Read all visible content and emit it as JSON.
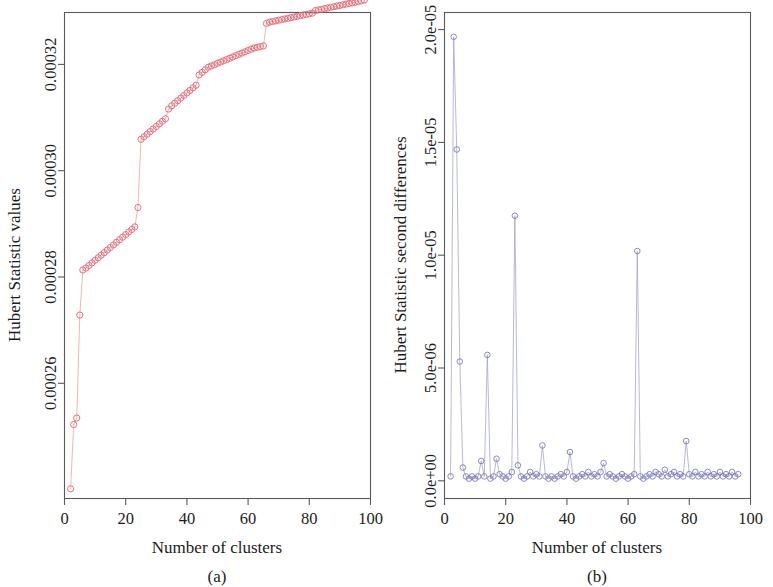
{
  "figure": {
    "background_color": "#ffffff",
    "panels": [
      {
        "id": "a",
        "caption": "(a)",
        "accent_color": "#e8636f"
      },
      {
        "id": "b",
        "caption": "(b)",
        "accent_color": "#6c6cba"
      }
    ]
  },
  "chart_data": [
    {
      "type": "line",
      "panel": "a",
      "title": "",
      "caption": "(a)",
      "xlabel": "Number of clusters",
      "ylabel": "Hubert Statistic values",
      "xlim": [
        0,
        100
      ],
      "ylim": [
        0.000251,
        0.0003265
      ],
      "grid": false,
      "legend": "none",
      "marker": "open-circle",
      "line_color": "#f2a0a6",
      "marker_color": "#e8636f",
      "xticks": [
        0,
        20,
        40,
        60,
        80,
        100
      ],
      "xticklabels": [
        "0",
        "20",
        "40",
        "60",
        "80",
        "100"
      ],
      "yticks": [
        0.00026,
        0.00028,
        0.0003,
        0.00032
      ],
      "yticklabels": [
        "0.00026",
        "0.00028",
        "0.00030",
        "0.00032"
      ],
      "x": [
        2,
        3,
        4,
        5,
        6,
        7,
        8,
        9,
        10,
        11,
        12,
        13,
        14,
        15,
        16,
        17,
        18,
        19,
        20,
        21,
        22,
        23,
        24,
        25,
        26,
        27,
        28,
        29,
        30,
        31,
        32,
        33,
        34,
        35,
        36,
        37,
        38,
        39,
        40,
        41,
        42,
        43,
        44,
        45,
        46,
        47,
        48,
        49,
        50,
        51,
        52,
        53,
        54,
        55,
        56,
        57,
        58,
        59,
        60,
        61,
        62,
        63,
        64,
        65,
        66,
        67,
        68,
        69,
        70,
        71,
        72,
        73,
        74,
        75,
        76,
        77,
        78,
        79,
        80,
        81,
        82,
        83,
        84,
        85,
        86,
        87,
        88,
        89,
        90,
        91,
        92,
        93,
        94,
        95,
        96,
        97,
        98
      ],
      "y": [
        0.0002525,
        0.0002625,
        0.0002635,
        0.0002795,
        0.0002865,
        0.0002868,
        0.0002872,
        0.0002876,
        0.000288,
        0.0002884,
        0.0002888,
        0.0002892,
        0.0002896,
        0.00029,
        0.0002904,
        0.0002908,
        0.0002912,
        0.0002916,
        0.000292,
        0.0002924,
        0.0002928,
        0.0002932,
        0.0002962,
        0.0003068,
        0.0003072,
        0.0003076,
        0.000308,
        0.0003084,
        0.0003088,
        0.0003092,
        0.0003096,
        0.00031,
        0.0003115,
        0.000312,
        0.0003124,
        0.0003128,
        0.0003132,
        0.0003136,
        0.000314,
        0.0003144,
        0.0003148,
        0.0003152,
        0.0003168,
        0.0003172,
        0.0003176,
        0.000318,
        0.0003182,
        0.0003184,
        0.0003186,
        0.0003188,
        0.000319,
        0.0003192,
        0.0003194,
        0.0003196,
        0.0003198,
        0.00032,
        0.0003202,
        0.0003204,
        0.0003206,
        0.0003208,
        0.000321,
        0.0003211,
        0.0003212,
        0.0003213,
        0.0003248,
        0.000325,
        0.0003251,
        0.0003252,
        0.0003253,
        0.0003254,
        0.0003255,
        0.0003256,
        0.0003257,
        0.0003258,
        0.0003259,
        0.000326,
        0.0003261,
        0.0003262,
        0.0003263,
        0.0003264,
        0.0003268,
        0.0003269,
        0.000327,
        0.0003271,
        0.0003272,
        0.0003273,
        0.0003274,
        0.0003275,
        0.0003276,
        0.0003277,
        0.0003278,
        0.0003279,
        0.000328,
        0.0003281,
        0.0003282,
        0.0003283
      ]
    },
    {
      "type": "line",
      "panel": "b",
      "title": "",
      "caption": "(b)",
      "xlabel": "Number of clusters",
      "ylabel": "Hubert Statistic second differences",
      "xlim": [
        0,
        100
      ],
      "ylim": [
        -8e-07,
        2.12e-05
      ],
      "grid": false,
      "legend": "none",
      "marker": "open-circle",
      "line_color": "#9a9ad0",
      "marker_color": "#6c6cba",
      "xticks": [
        0,
        20,
        40,
        60,
        80,
        100
      ],
      "xticklabels": [
        "0",
        "20",
        "40",
        "60",
        "80",
        "100"
      ],
      "yticks": [
        0,
        5e-06,
        1e-05,
        1.5e-05,
        2e-05
      ],
      "yticklabels": [
        "0.0e+00",
        "5.0e-06",
        "1.0e-05",
        "1.5e-05",
        "2.0e-05"
      ],
      "x": [
        2,
        3,
        4,
        5,
        6,
        7,
        8,
        9,
        10,
        11,
        12,
        13,
        14,
        15,
        16,
        17,
        18,
        19,
        20,
        21,
        22,
        23,
        24,
        25,
        26,
        27,
        28,
        29,
        30,
        31,
        32,
        33,
        34,
        35,
        36,
        37,
        38,
        39,
        40,
        41,
        42,
        43,
        44,
        45,
        46,
        47,
        48,
        49,
        50,
        51,
        52,
        53,
        54,
        55,
        56,
        57,
        58,
        59,
        60,
        61,
        62,
        63,
        64,
        65,
        66,
        67,
        68,
        69,
        70,
        71,
        72,
        73,
        74,
        75,
        76,
        77,
        78,
        79,
        80,
        81,
        82,
        83,
        84,
        85,
        86,
        87,
        88,
        89,
        90,
        91,
        92,
        93,
        94,
        95,
        96
      ],
      "y": [
        2e-07,
        2.01e-05,
        1.5e-05,
        5.4e-06,
        6e-07,
        2e-07,
        1e-07,
        2e-07,
        1e-07,
        2e-07,
        9e-07,
        2e-07,
        5.7e-06,
        1e-07,
        2e-07,
        1e-06,
        3e-07,
        2e-07,
        1e-07,
        2e-07,
        4e-07,
        1.2e-05,
        7e-07,
        2e-07,
        1e-07,
        2e-07,
        4e-07,
        2e-07,
        3e-07,
        2e-07,
        1.6e-06,
        2e-07,
        1e-07,
        2e-07,
        1e-07,
        2e-07,
        3e-07,
        2e-07,
        4e-07,
        1.3e-06,
        2e-07,
        1e-07,
        2e-07,
        3e-07,
        2e-07,
        4e-07,
        2e-07,
        3e-07,
        2e-07,
        4e-07,
        8e-07,
        2e-07,
        3e-07,
        2e-07,
        1e-07,
        2e-07,
        3e-07,
        2e-07,
        1e-07,
        2e-07,
        3e-07,
        1.04e-05,
        2e-07,
        1e-07,
        2e-07,
        3e-07,
        2e-07,
        4e-07,
        3e-07,
        2e-07,
        5e-07,
        2e-07,
        3e-07,
        4e-07,
        2e-07,
        3e-07,
        2e-07,
        1.8e-06,
        3e-07,
        2e-07,
        4e-07,
        2e-07,
        3e-07,
        2e-07,
        4e-07,
        2e-07,
        3e-07,
        2e-07,
        4e-07,
        2e-07,
        3e-07,
        2e-07,
        4e-07,
        2e-07,
        3e-07
      ]
    }
  ]
}
